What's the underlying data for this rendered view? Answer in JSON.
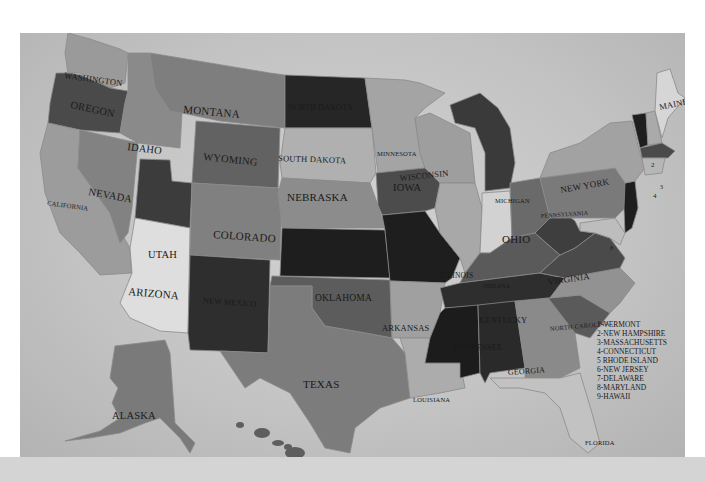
{
  "map": {
    "title": "United States map",
    "palette": {
      "background": "#c6c6c6",
      "darkest": "#2a2a2a",
      "dark": "#4a4a4a",
      "mid_dark": "#626262",
      "mid": "#7a7a7a",
      "mid_light": "#959595",
      "light": "#b2b2b2",
      "lightest": "#dcdcdc",
      "band": "#d4d4d4"
    },
    "states": {
      "washington": "WASHINGTON",
      "oregon": "OREGON",
      "california": "CALIFORNIA",
      "nevada": "NEVADA",
      "idaho": "IDAHO",
      "montana": "MONTANA",
      "wyoming": "WYOMING",
      "utah": "UTAH",
      "arizona": "ARIZONA",
      "colorado": "COLORADO",
      "new_mexico": "NEW MEXICO",
      "north_dakota": "NORTH DAKOTA",
      "south_dakota": "SOUTH DAKOTA",
      "nebraska": "NEBRASKA",
      "kansas": "KANSAS",
      "oklahoma": "OKLAHOMA",
      "texas": "TEXAS",
      "minnesota": "MINNESOTA",
      "iowa": "IOWA",
      "missouri": "MISSOURI",
      "arkansas": "ARKANSAS",
      "louisiana": "LOUISIANA",
      "wisconsin": "WISCONSIN",
      "illinois": "ILLINOIS",
      "michigan": "MICHIGAN",
      "indiana": "INDIANA",
      "ohio": "OHIO",
      "kentucky": "KENTUCKY",
      "tennessee": "TENNESSEE",
      "mississippi": "MISSISSIPPI",
      "alabama": "ALABAMA",
      "georgia": "GEORGIA",
      "florida": "FLORIDA",
      "south_carolina": "SOUTH CAROLINA",
      "north_carolina": "NORTH CAROLINA",
      "virginia": "VIRGINIA",
      "west_virginia": "WEST VIRGINIA",
      "pennsylvania": "PENNSYLVANIA",
      "new_york": "NEW YORK",
      "maine": "MAINE",
      "alaska": "ALASKA"
    },
    "number_markers": {
      "nh": "2",
      "ma": "3",
      "ct": "4",
      "md": "8"
    },
    "legend": [
      "1-VERMONT",
      "2-NEW HAMPSHIRE",
      "3-MASSACHUSETTS",
      "4-CONNECTICUT",
      "5 RHODE ISLAND",
      "6-NEW JERSEY",
      "7-DELAWARE",
      "8-MARYLAND",
      "9-HAWAII"
    ]
  }
}
